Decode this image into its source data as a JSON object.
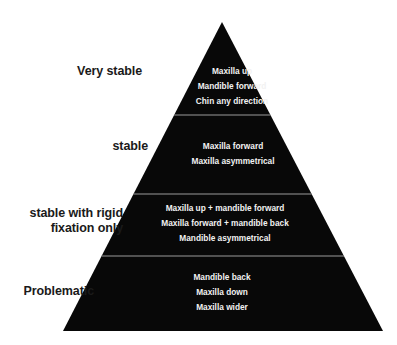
{
  "diagram": {
    "type": "pyramid",
    "background_color": "#ffffff",
    "body_color": "#080808",
    "divider_color": "#9a9a9a",
    "label_color": "#1a1a1a",
    "item_color": "#f2f2f2",
    "apex": {
      "x": 222,
      "y": 22
    },
    "base_left": {
      "x": 63,
      "y": 331
    },
    "base_right": {
      "x": 383,
      "y": 331
    },
    "divider_y": [
      115,
      194,
      256
    ],
    "tiers": [
      {
        "rank": 1,
        "label": "Very stable",
        "items": [
          "Maxilla up",
          "Mandible forward",
          "Chin any direction"
        ]
      },
      {
        "rank": 2,
        "label": "stable",
        "items": [
          "Maxilla forward",
          "Maxilla asymmetrical"
        ]
      },
      {
        "rank": 3,
        "label": "stable with rigid\nfixation only",
        "items": [
          "Maxilla up + mandible forward",
          "Maxilla forward + mandible back",
          "Mandible asymmetrical"
        ]
      },
      {
        "rank": 4,
        "label": "Problematic",
        "items": [
          "Mandible back",
          "Maxilla down",
          "Maxilla wider"
        ]
      }
    ]
  }
}
